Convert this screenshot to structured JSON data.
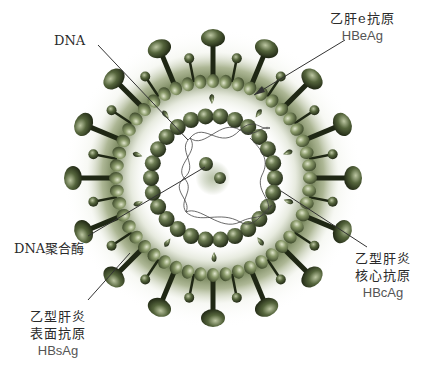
{
  "diagram": {
    "colors": {
      "virus_dark": "#2f3a22",
      "virus_mid": "#5a6b45",
      "virus_light": "#a8b48e",
      "halo": "#7a8a5c",
      "leader_line": "#333333",
      "text": "#2a2a2a",
      "background": "#ffffff"
    },
    "center": {
      "x": 213,
      "y": 178
    },
    "labels": {
      "dna": {
        "text": "DNA"
      },
      "hbeag": {
        "cn": "乙肝e抗原",
        "en": "HBeAg"
      },
      "dna_polymerase": {
        "text": "DNA聚合酶"
      },
      "hbsag": {
        "cn_line1": "乙型肝炎",
        "cn_line2": "表面抗原",
        "en": "HBsAg"
      },
      "hbcag": {
        "cn_line1": "乙型肝炎",
        "cn_line2": "核心抗原",
        "en": "HBcAg"
      }
    },
    "leader_lines": [
      {
        "name": "dna",
        "x1": 98,
        "y1": 45,
        "x2": 188,
        "y2": 140
      },
      {
        "name": "hbeag",
        "x1": 345,
        "y1": 40,
        "x2": 254,
        "y2": 95
      },
      {
        "name": "dna_polymerase",
        "x1": 88,
        "y1": 236,
        "x2": 205,
        "y2": 167
      },
      {
        "name": "hbsag",
        "x1": 88,
        "y1": 300,
        "x2": 130,
        "y2": 253
      },
      {
        "name": "hbcag",
        "x1": 367,
        "y1": 247,
        "x2": 281,
        "y2": 191
      }
    ]
  }
}
